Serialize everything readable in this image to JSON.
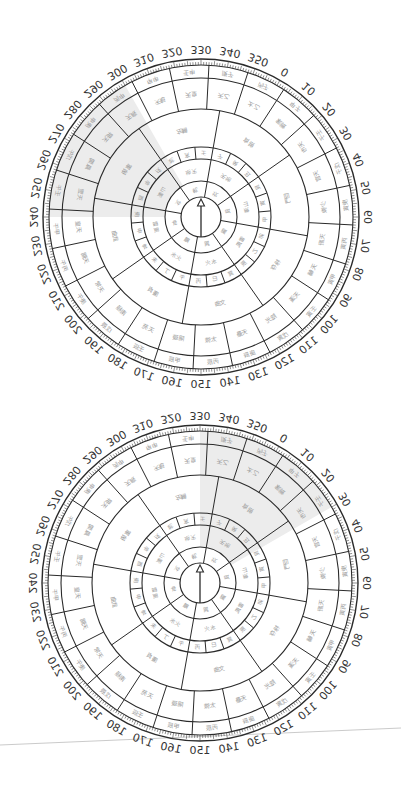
{
  "page": {
    "width": 401,
    "height": 800,
    "background": "#ffffff"
  },
  "colors": {
    "line": "#2a2a2a",
    "tick": "#444444",
    "label": "#333333",
    "cell_text": "#9a9a9a",
    "highlight": "#ececec",
    "scan_line": "#bdbdbd"
  },
  "scan_line": {
    "x1": 0,
    "y1": 745,
    "x2": 401,
    "y2": 728
  },
  "degree_scale": {
    "label_at_top": 330,
    "step": 10,
    "direction": "clockwise",
    "labels": [
      "330",
      "340",
      "350",
      "0",
      "10",
      "20",
      "30",
      "40",
      "50",
      "60",
      "70",
      "80",
      "90",
      "100",
      "110",
      "120",
      "130",
      "140",
      "150",
      "160",
      "170",
      "180",
      "190",
      "200",
      "210",
      "220",
      "230",
      "240",
      "250",
      "260",
      "270",
      "280",
      "290",
      "300",
      "310",
      "320"
    ],
    "mirrored": true
  },
  "rings": {
    "inner_radius": 20,
    "ring1": {
      "outer": 36,
      "divisions": 8,
      "offset_deg": 10,
      "chars": [
        "坎",
        "艮",
        "震",
        "巽",
        "離",
        "坤",
        "兌",
        "乾"
      ]
    },
    "ring2": {
      "outer": 58,
      "divisions": 8,
      "offset_deg": 10,
      "chars": [
        "天地",
        "山澤",
        "雷風",
        "水火",
        "火水",
        "風雷",
        "澤山",
        "地天"
      ]
    },
    "ring3": {
      "outer": 70,
      "divisions": 24,
      "offset_deg": 10,
      "chars": [
        "子",
        "癸",
        "丑",
        "艮",
        "寅",
        "甲",
        "卯",
        "乙",
        "辰",
        "巽",
        "巳",
        "丙",
        "午",
        "丁",
        "未",
        "坤",
        "申",
        "庚",
        "酉",
        "辛",
        "戌",
        "乾",
        "亥",
        "壬"
      ]
    },
    "ring4": {
      "outer": 108,
      "divisions": 8,
      "offset_deg": 10,
      "chars": [
        "貪狼",
        "巨門",
        "祿存",
        "文曲",
        "廉貞",
        "武曲",
        "破軍",
        "左輔"
      ]
    },
    "ring5": {
      "outer": 139,
      "divisions": 24,
      "offset_deg": 3,
      "chars": [
        "天乙",
        "太乙",
        "紫微",
        "天市",
        "天官",
        "少微",
        "天廚",
        "天輔",
        "天漢",
        "陰光",
        "天壘",
        "太微",
        "陽璇",
        "天苑",
        "南極",
        "天常",
        "天關",
        "天皇",
        "天罡",
        "鳳閣",
        "天屏",
        "天廄",
        "天魁",
        "天皇"
      ]
    },
    "ring6": {
      "outer": 152,
      "divisions": 24,
      "offset_deg": 3,
      "chars": [
        "庚子",
        "丙子",
        "甲子",
        "壬子",
        "戊子",
        "庚寅",
        "丙寅",
        "甲寅",
        "壬寅",
        "戊寅",
        "庚辰",
        "丙辰",
        "甲辰",
        "壬辰",
        "戊辰",
        "庚午",
        "丙午",
        "甲午",
        "壬午",
        "戊午",
        "庚申",
        "丙申",
        "甲申",
        "壬申"
      ]
    },
    "tick_band": {
      "inner": 152,
      "outer": 158
    },
    "label_radius": 168
  },
  "compasses": [
    {
      "id": "top",
      "cx": 201,
      "cy": 217,
      "arrow": {
        "tip_dy": -18,
        "base_dy": 20
      },
      "highlight_sector": {
        "from_deg": 270,
        "to_deg": 330,
        "rings": [
          "ring2",
          "ring3",
          "ring4",
          "ring5",
          "ring6"
        ]
      }
    },
    {
      "id": "bottom",
      "cx": 200,
      "cy": 583,
      "arrow": {
        "tip_dy": -18,
        "base_dy": 20
      },
      "highlight_sector": {
        "from_deg": 0,
        "to_deg": 60,
        "rings": [
          "ring2",
          "ring3",
          "ring4",
          "ring5",
          "ring6"
        ]
      }
    }
  ]
}
